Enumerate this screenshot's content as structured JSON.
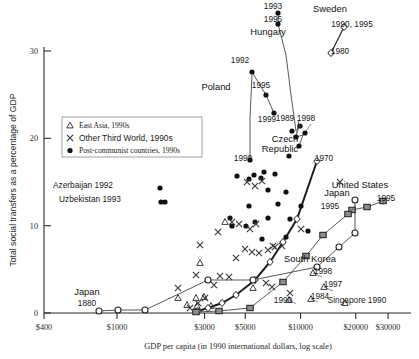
{
  "chart_data": {
    "type": "scatter",
    "title": "",
    "xlabel": "GDP per capita (in 1990 international dollars, log scale)",
    "ylabel": "Total social transfers as a percentage of GDP",
    "xticks": [
      "$400",
      "$1000",
      "$3000",
      "$5000",
      "$10000",
      "$20000",
      "$30000"
    ],
    "xtick_values": [
      400,
      1000,
      3000,
      5000,
      10000,
      20000,
      30000
    ],
    "yticks": [
      "0",
      "10",
      "20",
      "30"
    ],
    "ytick_values": [
      0,
      10,
      20,
      30
    ],
    "xlim": [
      400,
      40000
    ],
    "ylim": [
      0,
      33
    ],
    "xscale": "log",
    "grid": false,
    "legend_position": "upper-left-inside",
    "legend": [
      {
        "marker": "triangle",
        "label": "East Asia, 1990s"
      },
      {
        "marker": "x",
        "label": "Other Third World, 1990s"
      },
      {
        "marker": "filled-circle",
        "label": "Post-communist countries, 1990s"
      }
    ],
    "annotations": [
      {
        "text": "1993",
        "px": 273,
        "py": 9
      },
      {
        "text": "1995",
        "px": 273,
        "py": 22
      },
      {
        "text": "Hungary",
        "px": 268,
        "py": 35
      },
      {
        "text": "Sweden",
        "px": 330,
        "py": 12
      },
      {
        "text": "1990, 1995",
        "px": 352,
        "py": 27
      },
      {
        "text": "1980",
        "px": 340,
        "py": 54
      },
      {
        "text": "1992",
        "px": 240,
        "py": 63
      },
      {
        "text": "Poland",
        "px": 216,
        "py": 90
      },
      {
        "text": "1995",
        "px": 261,
        "py": 88
      },
      {
        "text": "1999",
        "px": 267,
        "py": 122
      },
      {
        "text": "1989",
        "px": 285,
        "py": 121
      },
      {
        "text": "1998",
        "px": 306,
        "py": 121
      },
      {
        "text": "Czech",
        "px": 285,
        "py": 142
      },
      {
        "text": "Republic",
        "px": 280,
        "py": 152
      },
      {
        "text": "1970",
        "px": 324,
        "py": 161
      },
      {
        "text": "1990",
        "px": 243,
        "py": 161
      },
      {
        "text": "Azerbaijan 1992",
        "px": 83,
        "py": 188
      },
      {
        "text": "Uzbekistan 1993",
        "px": 90,
        "py": 202
      },
      {
        "text": "United States",
        "px": 360,
        "py": 188
      },
      {
        "text": "1995",
        "px": 386,
        "py": 201
      },
      {
        "text": "Japan",
        "px": 337,
        "py": 196
      },
      {
        "text": "1995",
        "px": 330,
        "py": 209
      },
      {
        "text": "South Korea",
        "px": 310,
        "py": 262
      },
      {
        "text": "1998",
        "px": 323,
        "py": 274
      },
      {
        "text": "1997",
        "px": 333,
        "py": 287
      },
      {
        "text": "1984",
        "px": 320,
        "py": 299
      },
      {
        "text": "1990",
        "px": 283,
        "py": 303
      },
      {
        "text": "Singapore 1990",
        "px": 357,
        "py": 303
      },
      {
        "text": "Japan",
        "px": 87,
        "py": 295
      },
      {
        "text": "1880",
        "px": 87,
        "py": 306
      }
    ],
    "series": [
      {
        "name": "Post-communist countries, 1990s",
        "marker": "filled-circle",
        "points": [
          {
            "px": 278,
            "py": 13
          },
          {
            "px": 278,
            "py": 24
          },
          {
            "px": 252,
            "py": 72
          },
          {
            "px": 266,
            "py": 95
          },
          {
            "px": 274,
            "py": 113
          },
          {
            "px": 292,
            "py": 131
          },
          {
            "px": 300,
            "py": 126
          },
          {
            "px": 296,
            "py": 137
          },
          {
            "px": 305,
            "py": 133
          },
          {
            "px": 299,
            "py": 146
          },
          {
            "px": 289,
            "py": 156
          },
          {
            "px": 250,
            "py": 160
          },
          {
            "px": 264,
            "py": 172
          },
          {
            "px": 254,
            "py": 175
          },
          {
            "px": 275,
            "py": 174
          },
          {
            "px": 261,
            "py": 178
          },
          {
            "px": 237,
            "py": 176
          },
          {
            "px": 249,
            "py": 179
          },
          {
            "px": 268,
            "py": 190
          },
          {
            "px": 286,
            "py": 192
          },
          {
            "px": 278,
            "py": 204
          },
          {
            "px": 249,
            "py": 206
          },
          {
            "px": 301,
            "py": 206
          },
          {
            "px": 290,
            "py": 219
          },
          {
            "px": 268,
            "py": 218
          },
          {
            "px": 255,
            "py": 222
          },
          {
            "px": 246,
            "py": 226
          },
          {
            "px": 232,
            "py": 226
          },
          {
            "px": 308,
            "py": 231
          },
          {
            "px": 286,
            "py": 237
          },
          {
            "px": 262,
            "py": 239
          },
          {
            "px": 230,
            "py": 218
          },
          {
            "px": 160,
            "py": 188
          },
          {
            "px": 161,
            "py": 202
          },
          {
            "px": 165,
            "py": 202
          }
        ]
      },
      {
        "name": "Other Third World, 1990s",
        "marker": "x",
        "points": [
          {
            "px": 247,
            "py": 182
          },
          {
            "px": 262,
            "py": 181
          },
          {
            "px": 255,
            "py": 186
          },
          {
            "px": 232,
            "py": 222
          },
          {
            "px": 239,
            "py": 224
          },
          {
            "px": 250,
            "py": 229
          },
          {
            "px": 256,
            "py": 224
          },
          {
            "px": 301,
            "py": 229
          },
          {
            "px": 273,
            "py": 246
          },
          {
            "px": 218,
            "py": 232
          },
          {
            "px": 245,
            "py": 249
          },
          {
            "px": 252,
            "py": 252
          },
          {
            "px": 259,
            "py": 253
          },
          {
            "px": 268,
            "py": 250
          },
          {
            "px": 275,
            "py": 247
          },
          {
            "px": 282,
            "py": 246
          },
          {
            "px": 200,
            "py": 245
          },
          {
            "px": 236,
            "py": 258
          },
          {
            "px": 196,
            "py": 275
          },
          {
            "px": 220,
            "py": 276
          },
          {
            "px": 229,
            "py": 277
          },
          {
            "px": 178,
            "py": 288
          },
          {
            "px": 214,
            "py": 285
          },
          {
            "px": 266,
            "py": 283
          },
          {
            "px": 272,
            "py": 287
          },
          {
            "px": 290,
            "py": 293
          },
          {
            "px": 340,
            "py": 182
          },
          {
            "px": 198,
            "py": 303
          },
          {
            "px": 205,
            "py": 298
          },
          {
            "px": 190,
            "py": 308
          }
        ]
      },
      {
        "name": "East Asia, 1990s",
        "marker": "triangle",
        "points": [
          {
            "px": 225,
            "py": 222
          },
          {
            "px": 200,
            "py": 263
          },
          {
            "px": 178,
            "py": 298
          },
          {
            "px": 196,
            "py": 298
          },
          {
            "px": 204,
            "py": 297
          },
          {
            "px": 253,
            "py": 288
          },
          {
            "px": 313,
            "py": 273
          },
          {
            "px": 324,
            "py": 287
          },
          {
            "px": 311,
            "py": 299
          },
          {
            "px": 289,
            "py": 300
          },
          {
            "px": 345,
            "py": 303
          },
          {
            "px": 187,
            "py": 305
          },
          {
            "px": 197,
            "py": 306
          },
          {
            "px": 211,
            "py": 306
          }
        ]
      },
      {
        "name": "Sweden historical",
        "marker": "diamond-open",
        "points": [
          {
            "px": 344,
            "py": 27
          },
          {
            "px": 331,
            "py": 53
          }
        ]
      },
      {
        "name": "United Kingdom historical",
        "marker": "diamond-open",
        "points": [
          {
            "px": 317,
            "py": 161
          },
          {
            "px": 297,
            "py": 219
          },
          {
            "px": 283,
            "py": 242
          },
          {
            "px": 270,
            "py": 262
          },
          {
            "px": 255,
            "py": 280
          },
          {
            "px": 236,
            "py": 295
          },
          {
            "px": 222,
            "py": 303
          },
          {
            "px": 208,
            "py": 308
          },
          {
            "px": 198,
            "py": 311
          }
        ]
      },
      {
        "name": "Japan historical",
        "marker": "circle-open",
        "points": [
          {
            "px": 355,
            "py": 200
          },
          {
            "px": 355,
            "py": 233
          },
          {
            "px": 339,
            "py": 247
          },
          {
            "px": 317,
            "py": 267
          },
          {
            "px": 253,
            "py": 280
          },
          {
            "px": 208,
            "py": 280
          },
          {
            "px": 145,
            "py": 310
          },
          {
            "px": 118,
            "py": 310
          },
          {
            "px": 99,
            "py": 311
          }
        ]
      },
      {
        "name": "United States historical",
        "marker": "filled-square",
        "points": [
          {
            "px": 383,
            "py": 201
          },
          {
            "px": 367,
            "py": 207
          },
          {
            "px": 352,
            "py": 210
          },
          {
            "px": 348,
            "py": 214
          },
          {
            "px": 323,
            "py": 235
          },
          {
            "px": 306,
            "py": 256
          },
          {
            "px": 283,
            "py": 282
          },
          {
            "px": 250,
            "py": 308
          },
          {
            "px": 219,
            "py": 311
          },
          {
            "px": 196,
            "py": 312
          }
        ]
      }
    ]
  },
  "axis": {
    "y_title": "Total social transfers as a percentage of GDP",
    "x_title": "GDP per capita (in 1990 international dollars, log scale)"
  }
}
